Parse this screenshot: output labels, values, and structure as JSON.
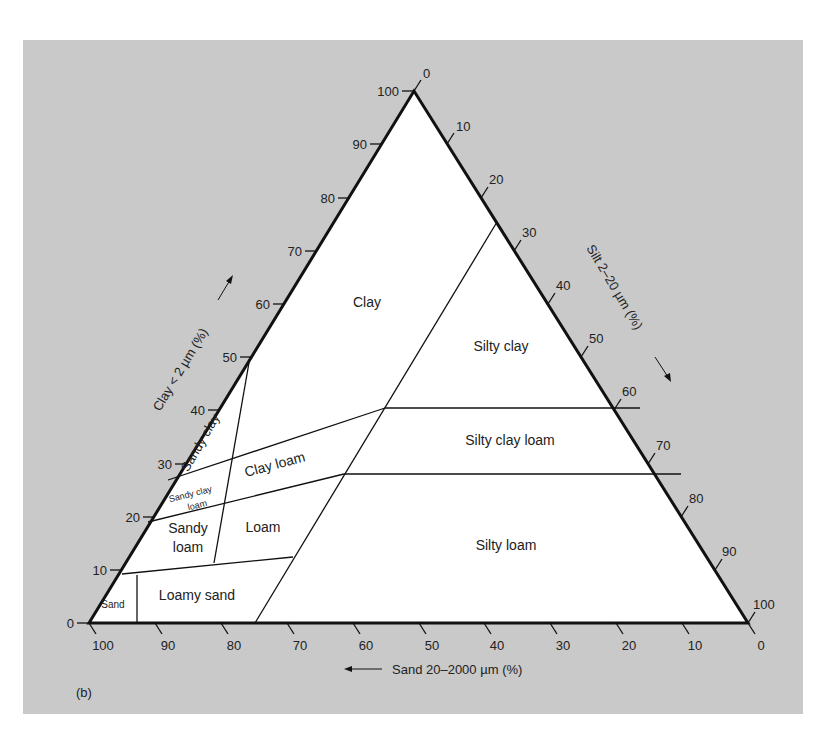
{
  "figure_label": "(b)",
  "colors": {
    "panel": "#c9c9c9",
    "triangle_fill": "#ffffff",
    "lines": "#111111",
    "text": "#222222"
  },
  "axes": {
    "clay": {
      "label": "Clay < 2 µm (%)",
      "ticks": [
        "0",
        "10",
        "20",
        "30",
        "40",
        "50",
        "60",
        "70",
        "80",
        "90",
        "100"
      ]
    },
    "silt": {
      "label": "Silt 2–20 µm (%)",
      "ticks": [
        "0",
        "10",
        "20",
        "30",
        "40",
        "50",
        "60",
        "70",
        "80",
        "90",
        "100"
      ]
    },
    "sand": {
      "label": "Sand 20–2000 µm (%)",
      "ticks": [
        "100",
        "90",
        "80",
        "70",
        "60",
        "50",
        "40",
        "30",
        "20",
        "10",
        "0"
      ]
    }
  },
  "regions": {
    "clay": "Clay",
    "silty_clay": "Silty clay",
    "sandy_clay": "Sandy clay",
    "clay_loam": "Clay loam",
    "silty_clay_loam": "Silty clay loam",
    "sandy_clay_loam_1": "Sandy clay",
    "sandy_clay_loam_2": "loam",
    "sandy_loam_1": "Sandy",
    "sandy_loam_2": "loam",
    "loam": "Loam",
    "silty_loam": "Silty loam",
    "loamy_sand": "Loamy sand",
    "sand": "Sand"
  }
}
